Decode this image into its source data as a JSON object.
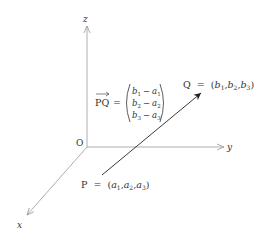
{
  "diagram": {
    "axes": {
      "z_label": "z",
      "y_label": "y",
      "x_label": "x",
      "origin_label": "O"
    },
    "points": {
      "P": {
        "name": "P",
        "equals": "=",
        "coords": [
          "a",
          "a",
          "a"
        ],
        "subscripts": [
          "1",
          "2",
          "3"
        ]
      },
      "Q": {
        "name": "Q",
        "equals": "=",
        "coords": [
          "b",
          "b",
          "b"
        ],
        "subscripts": [
          "1",
          "2",
          "3"
        ]
      }
    },
    "vector": {
      "name": "PQ",
      "equals": "=",
      "rows": [
        {
          "b": "b",
          "bs": "1",
          "minus": "−",
          "a": "a",
          "as": "1"
        },
        {
          "b": "b",
          "bs": "2",
          "minus": "−",
          "a": "a",
          "as": "2"
        },
        {
          "b": "b",
          "bs": "3",
          "minus": "−",
          "a": "a",
          "as": "3"
        }
      ]
    },
    "colors": {
      "axis": "#999999",
      "vector": "#222222",
      "text": "#333333"
    }
  }
}
